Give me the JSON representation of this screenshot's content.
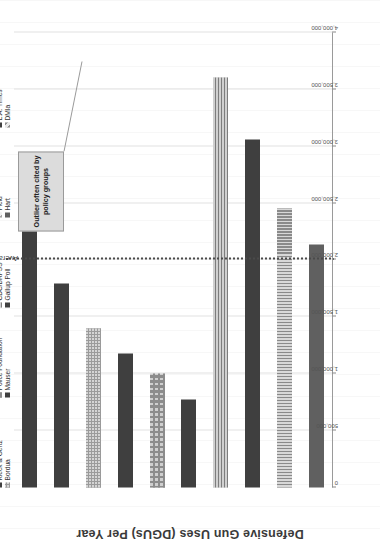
{
  "chart_data": {
    "type": "bar",
    "orientation": "horizontal",
    "title": "",
    "xlabel": "",
    "ylabel": "Defensive Gun Uses (DGUs) Per Year",
    "ylim": [
      0,
      4000000
    ],
    "tick_labels": [
      "0",
      "500,000",
      "1,000,000",
      "1,500,000",
      "2,000,000",
      "2,500,000",
      "3,000,000",
      "3,500,000",
      "4,000,000"
    ],
    "tick_values": [
      0,
      500000,
      1000000,
      1500000,
      2000000,
      2500000,
      3000000,
      3500000,
      4000000
    ],
    "grid": true,
    "legend_position": "bottom",
    "categories": [
      "Kleck & Gertz",
      "Bordua",
      "Police Foundation",
      "Mauser",
      "CDC/BRFSS",
      "Gallup Poll",
      "Field",
      "Hart",
      "L.A. Times",
      "DMIa"
    ],
    "series": [
      {
        "name": "DGUs Per Year",
        "values": [
          2500000,
          1790000,
          1400000,
          1180000,
          1000000,
          770000,
          3600000,
          3060000,
          2450000,
          2140000
        ]
      }
    ],
    "bars": [
      {
        "label": "Kleck & Gertz",
        "value": 2500000,
        "pattern": "solid-dark",
        "outlier": true
      },
      {
        "label": "Bordua",
        "value": 1790000,
        "pattern": "solid-dark",
        "outlier": false
      },
      {
        "label": "Police Foundation",
        "value": 1400000,
        "pattern": "check",
        "outlier": false
      },
      {
        "label": "Mauser",
        "value": 1180000,
        "pattern": "solid-dark",
        "outlier": false
      },
      {
        "label": "CDC/BRFSS",
        "value": 1000000,
        "pattern": "grid-coarse",
        "outlier": false
      },
      {
        "label": "Gallup Poll",
        "value": 770000,
        "pattern": "solid-dark",
        "outlier": false
      },
      {
        "label": "Field",
        "value": 3600000,
        "pattern": "horz",
        "outlier": false
      },
      {
        "label": "Hart",
        "value": 3060000,
        "pattern": "solid-dark",
        "outlier": false
      },
      {
        "label": "L.A. Times",
        "value": 2450000,
        "pattern": "vert",
        "outlier": false
      },
      {
        "label": "DMIa",
        "value": 2140000,
        "pattern": "solid-mid",
        "outlier": false
      }
    ],
    "annotations": [
      {
        "name": "average-line",
        "text": "Average of non-outlier studies",
        "value": 2000000,
        "style": "dotted-vertical"
      },
      {
        "name": "outlier-callout",
        "text": "Outlier often cited by policy groups",
        "points_to": "Kleck & Gertz"
      }
    ],
    "legend": [
      {
        "label": "Kleck & Gertz",
        "pattern": "solid-dark"
      },
      {
        "label": "Bordua",
        "pattern": "check"
      },
      {
        "label": "Police Foundation",
        "pattern": "grid-coarse"
      },
      {
        "label": "Mauser",
        "pattern": "solid-dark"
      },
      {
        "label": "CDC/BRFSS",
        "pattern": "horz"
      },
      {
        "label": "Gallup Poll",
        "pattern": "solid-dark"
      },
      {
        "label": "Field",
        "pattern": "diag-light"
      },
      {
        "label": "Hart",
        "pattern": "solid-mid"
      },
      {
        "label": "L.A. Times",
        "pattern": "solid-dark"
      },
      {
        "label": "DMIa",
        "pattern": "diag-mid"
      }
    ],
    "colors": {
      "bar_dark": "#3f3f3f",
      "bar_mid": "#606060",
      "bar_light": "#d8d8d8",
      "gridline": "#e2e2e2",
      "average_line": "#4a4a4a",
      "callout_bg": "#dcdcdc",
      "callout_border": "#9a9a9a"
    }
  }
}
